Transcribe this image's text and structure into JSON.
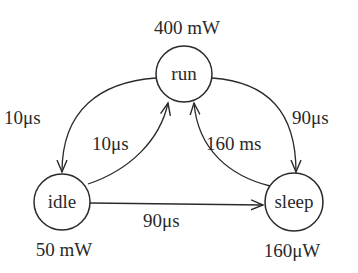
{
  "diagram": {
    "type": "state-machine",
    "states": [
      {
        "id": "run",
        "label": "run",
        "power": "400 mW"
      },
      {
        "id": "idle",
        "label": "idle",
        "power": "50 mW"
      },
      {
        "id": "sleep",
        "label": "sleep",
        "power": "160μW"
      }
    ],
    "transitions": [
      {
        "from": "run",
        "to": "idle",
        "label": "10μs"
      },
      {
        "from": "idle",
        "to": "run",
        "label": "10μs"
      },
      {
        "from": "run",
        "to": "sleep",
        "label": "90μs"
      },
      {
        "from": "sleep",
        "to": "run",
        "label": "160 ms"
      },
      {
        "from": "idle",
        "to": "sleep",
        "label": "90μs"
      }
    ]
  }
}
